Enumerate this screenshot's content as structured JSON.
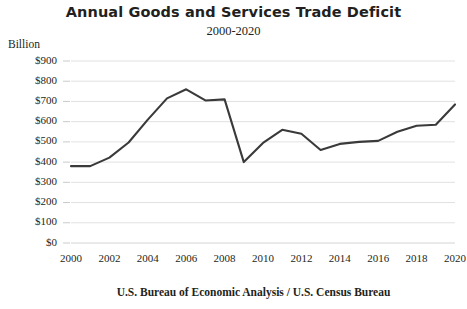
{
  "chart_data": {
    "type": "line",
    "title": "Annual Goods and Services Trade Deficit",
    "subtitle": "2000-2020",
    "unit_label": "Billion",
    "source": "U.S. Bureau of Economic Analysis / U.S. Census Bureau",
    "xlabel": "",
    "ylabel": "Billion",
    "xlim": [
      2000,
      2020
    ],
    "ylim": [
      0,
      900
    ],
    "grid": true,
    "legend": "none",
    "line_color": "#3a3a3a",
    "grid_color": "#d9d9d9",
    "y_ticks": [
      0,
      100,
      200,
      300,
      400,
      500,
      600,
      700,
      800,
      900
    ],
    "y_tick_labels": [
      "$0",
      "$100",
      "$200",
      "$300",
      "$400",
      "$500",
      "$600",
      "$700",
      "$800",
      "$900"
    ],
    "x_ticks": [
      2000,
      2002,
      2004,
      2006,
      2008,
      2010,
      2012,
      2014,
      2016,
      2018,
      2020
    ],
    "x_tick_labels": [
      "2000",
      "2002",
      "2004",
      "2006",
      "2008",
      "2010",
      "2012",
      "2014",
      "2016",
      "2018",
      "2020"
    ],
    "x": [
      2000,
      2001,
      2002,
      2003,
      2004,
      2005,
      2006,
      2007,
      2008,
      2009,
      2010,
      2011,
      2012,
      2013,
      2014,
      2015,
      2016,
      2017,
      2018,
      2019,
      2020
    ],
    "values": [
      380,
      380,
      422,
      497,
      610,
      715,
      760,
      705,
      710,
      400,
      495,
      560,
      540,
      460,
      490,
      500,
      505,
      550,
      580,
      585,
      685
    ],
    "series": [
      {
        "name": "Annual Goods and Services Trade Deficit",
        "values": [
          380,
          380,
          422,
          497,
          610,
          715,
          760,
          705,
          710,
          400,
          495,
          560,
          540,
          460,
          490,
          500,
          505,
          550,
          580,
          585,
          685
        ]
      }
    ]
  }
}
